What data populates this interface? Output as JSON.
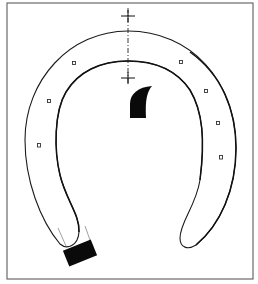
{
  "figure": {
    "colors": {
      "background": "#ffffff",
      "line": "#1a1a1a",
      "frame": "#6a6a6a",
      "fill_solid": "#0a0a0a"
    },
    "frame": {
      "x": 7,
      "y": 3,
      "width": 246,
      "height": 276
    },
    "centerline": {
      "x": 128,
      "y_start": 8,
      "y_end": 84
    },
    "crosses": [
      {
        "name": "upper-cross",
        "x": 128,
        "y": 16
      },
      {
        "name": "lower-cross",
        "x": 128,
        "y": 78
      }
    ],
    "nail_holes": {
      "left": [
        {
          "x": 74,
          "y": 63
        },
        {
          "x": 49,
          "y": 101
        },
        {
          "x": 39,
          "y": 145
        }
      ],
      "right": [
        {
          "x": 181,
          "y": 62
        },
        {
          "x": 206,
          "y": 91
        },
        {
          "x": 218,
          "y": 123
        },
        {
          "x": 221,
          "y": 157
        }
      ]
    },
    "toe_clip": {
      "x": 130,
      "y": 86,
      "width": 22,
      "height": 32
    },
    "heel_block": {
      "cx": 80,
      "cy": 253,
      "width": 30,
      "height": 17,
      "rotation": -22
    }
  }
}
